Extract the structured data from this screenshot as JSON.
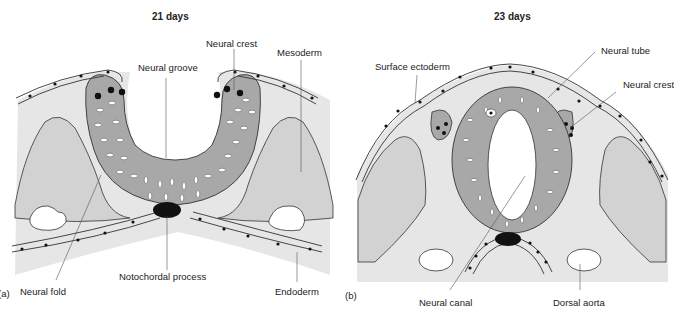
{
  "panel_a": {
    "title": "21 days",
    "tag": "(a)",
    "labels": {
      "neural_crest": "Neural crest",
      "mesoderm": "Mesoderm",
      "neural_groove": "Neural groove",
      "neural_fold": "Neural fold",
      "notochordal_process": "Notochordal process",
      "endoderm": "Endoderm"
    }
  },
  "panel_b": {
    "title": "23 days",
    "tag": "(b)",
    "labels": {
      "neural_tube": "Neural tube",
      "surface_ectoderm": "Surface ectoderm",
      "neural_crest": "Neural crest",
      "neural_canal": "Neural canal",
      "dorsal_aorta": "Dorsal aorta"
    }
  },
  "colors": {
    "mesenchyme": "#e6e6e6",
    "somite": "#d2d2d2",
    "neural_tissue": "#a8a8a8",
    "notochord": "#111111",
    "outline": "#333333"
  }
}
